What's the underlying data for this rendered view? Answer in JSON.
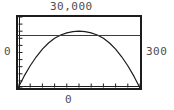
{
  "graph": {
    "labels": {
      "y_max": "30,000",
      "y_min": "0",
      "x_max": "300",
      "x_min": "0"
    },
    "colors": {
      "frame": "#1c1c1c",
      "curve": "#1c1c1c",
      "hline": "#3b3b3b",
      "label_text": "#4d4d4d",
      "background": "#ffffff"
    }
  },
  "chart_data": {
    "type": "line",
    "title": "",
    "xlabel": "",
    "ylabel": "",
    "xlim": [
      0,
      300
    ],
    "ylim": [
      0,
      30000
    ],
    "grid": false,
    "legend": null,
    "x_tick_labels": [
      "0",
      "300"
    ],
    "y_tick_labels": [
      "0",
      "30,000"
    ],
    "x_tick_count": 11,
    "y_tick_count": 11,
    "series": [
      {
        "name": "parabola",
        "type": "line",
        "x": [
          0,
          15,
          30,
          45,
          60,
          75,
          90,
          105,
          120,
          135,
          150,
          165,
          180,
          195,
          210,
          225,
          240,
          255,
          270,
          285,
          300
        ],
        "values": [
          0,
          5000,
          9400,
          13200,
          16400,
          19000,
          21000,
          22400,
          23300,
          23800,
          24000,
          23800,
          23300,
          22400,
          21000,
          19000,
          16400,
          13200,
          9400,
          5000,
          0
        ]
      },
      {
        "name": "horizontal-line",
        "type": "line",
        "x": [
          0,
          300
        ],
        "values": [
          22200,
          22200
        ]
      }
    ]
  }
}
